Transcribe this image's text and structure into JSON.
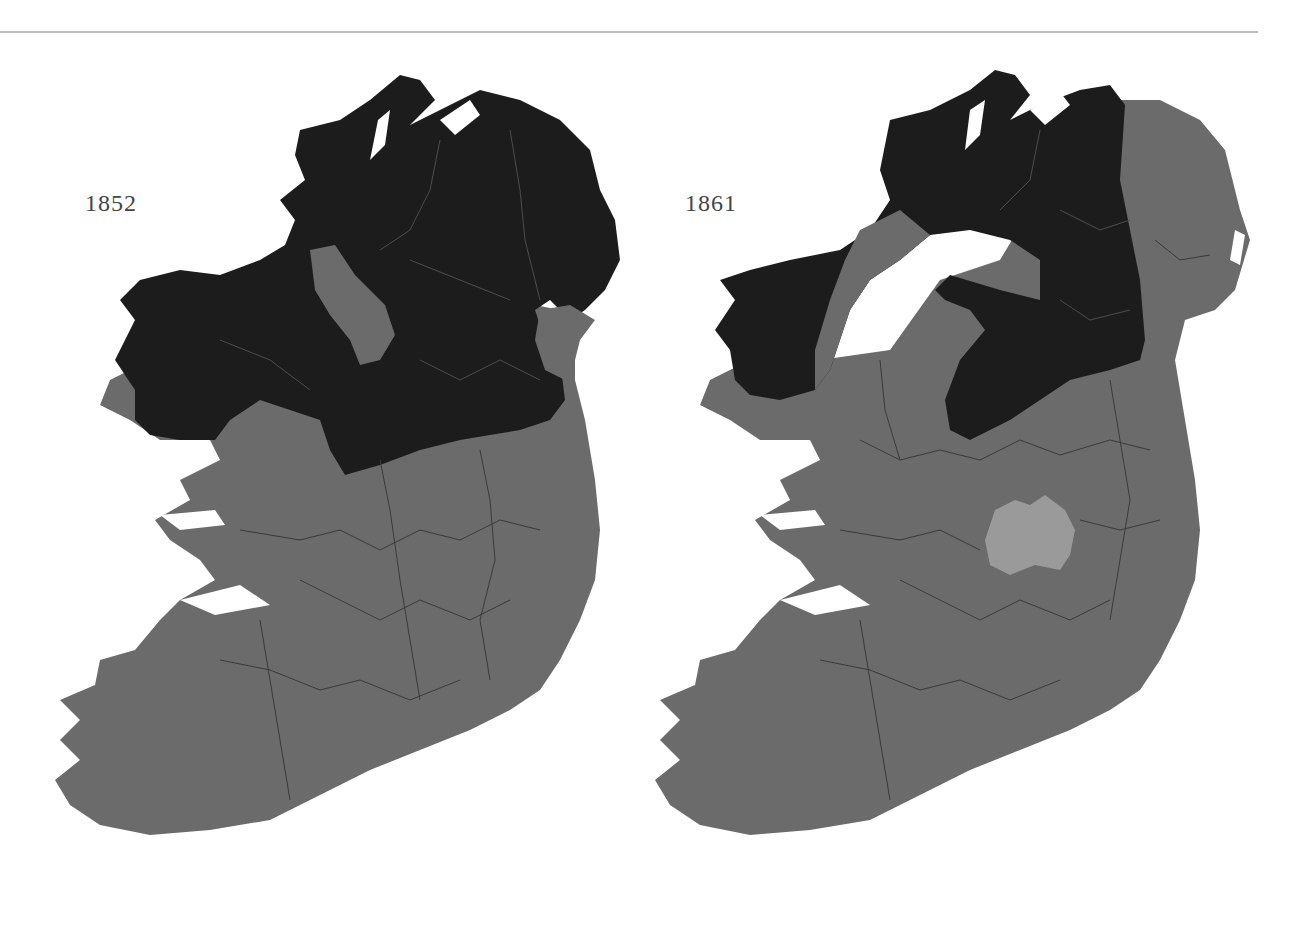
{
  "page": {
    "header_fragment": "· · · · · · · · ·",
    "background": "#ffffff",
    "rule_color": "#bdbdbd"
  },
  "legend_colors": {
    "dark_region": "#1c1c1c",
    "grey_region": "#6b6b6b",
    "light_region": "#9a9a9a",
    "boundary_lines": "#444444"
  },
  "maps": [
    {
      "year": "1852",
      "description": "Ireland by county; northern half (Ulster, Connacht north, north Leinster) shaded dark, south shaded grey, small grey strip in Leitrim and grey Louth coast"
    },
    {
      "year": "1861",
      "description": "Ireland by county; dark band through Donegal, Derry, Tyrone, Fermanagh, Cavan, Monaghan, Longford/Westmeath and north Mayo; Antrim/Down grey; single lighter county (Laois) in midlands"
    }
  ]
}
